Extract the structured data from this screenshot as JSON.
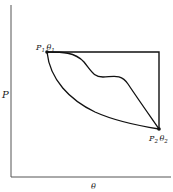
{
  "diagram": {
    "type": "P-theta process paths",
    "axes": {
      "y_label": "P",
      "x_label": "θ"
    },
    "points": [
      {
        "id": "state-1",
        "label_p": "P",
        "sub_p": "1",
        "label_t": "θ",
        "sub_t": "1"
      },
      {
        "id": "state-2",
        "label_p": "P",
        "sub_p": "2",
        "label_t": "θ",
        "sub_t": "2"
      }
    ],
    "paths": [
      {
        "id": "rectangular-path",
        "description": "horizontal then vertical path from state 1 to state 2"
      },
      {
        "id": "wavy-path",
        "description": "irregular S-shaped path from state 1 to state 2"
      },
      {
        "id": "concave-path",
        "description": "smooth concave curve from state 1 to state 2"
      }
    ],
    "colors": {
      "line": "#111111",
      "background": "#ffffff"
    }
  }
}
